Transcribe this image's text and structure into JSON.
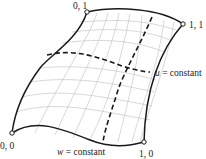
{
  "diagram": {
    "corners": [
      {
        "id": "c00",
        "label": "0, 0",
        "x": 12,
        "y": 133
      },
      {
        "id": "c01",
        "label": "0, 1",
        "x": 87,
        "y": 12
      },
      {
        "id": "c11",
        "label": "1, 1",
        "x": 183,
        "y": 24
      },
      {
        "id": "c10",
        "label": "1, 0",
        "x": 144,
        "y": 142
      }
    ],
    "isoparametric_labels": {
      "u": {
        "var": "u",
        "text": " = constant"
      },
      "w": {
        "var": "w",
        "text": " = constant"
      }
    },
    "colors": {
      "boundary": "#1a1a1a",
      "grid": "#b8b8b8",
      "dashed": "#1a1a1a",
      "background": "#ffffff"
    }
  }
}
